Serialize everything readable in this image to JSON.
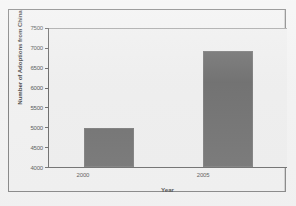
{
  "chart_data": {
    "type": "bar",
    "title": "",
    "xlabel": "Year",
    "ylabel": "Number of Adoptions from China",
    "categories": [
      "2000",
      "2005"
    ],
    "values": [
      4990,
      6930
    ],
    "ylim": [
      4000,
      7500
    ],
    "ytick_labels": [
      "7500",
      "7000",
      "6500",
      "6000",
      "5500",
      "5000",
      "4500",
      "4000"
    ],
    "ytick_values": [
      7500,
      7000,
      6500,
      6000,
      5500,
      5000,
      4500,
      4000
    ],
    "grid": false,
    "legend": null,
    "series": [
      {
        "name": "Adoptions from China",
        "values": [
          4990,
          6930
        ],
        "color": "#5c5c5c"
      }
    ]
  },
  "colors": {
    "page_background": "#f2f2f2",
    "figure_background": "#f0f0f0",
    "plot_background": "#ededed",
    "bar_fill": "#5c5c5c",
    "axis_line": "#555555",
    "frame_border": "#6e6e6e",
    "text": "#2b2b2b"
  }
}
